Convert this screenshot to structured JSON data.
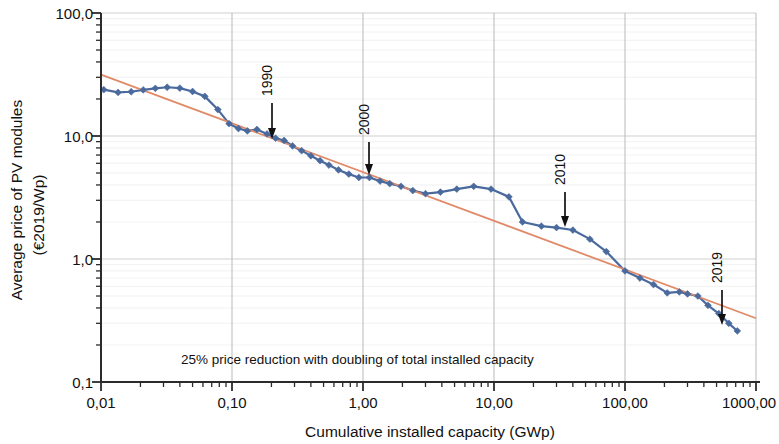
{
  "chart_data": {
    "type": "line",
    "title": "",
    "xlabel": "Cumulative installed capacity (GWp)",
    "ylabel_line1": "Average price of PV modules",
    "ylabel_line2": "(€2019/Wp)",
    "xscale": "log",
    "yscale": "log",
    "xlim": [
      0.01,
      1000
    ],
    "ylim": [
      0.1,
      100
    ],
    "grid": true,
    "legend": "none",
    "xtick_labels": [
      "0,01",
      "0,10",
      "1,00",
      "10,00",
      "100,00",
      "1000,00"
    ],
    "xtick_values": [
      0.01,
      0.1,
      1,
      10,
      100,
      1000
    ],
    "ytick_labels": [
      "100,0",
      "10,0",
      "1,0",
      "0,1"
    ],
    "ytick_values": [
      100,
      10,
      1,
      0.1
    ],
    "annotation_text": "25% price reduction with doubling of total installed capacity",
    "series": [
      {
        "name": "Average price of PV modules",
        "color": "#4a6a9e",
        "marker": "diamond",
        "points": [
          [
            0.0105,
            23.8
          ],
          [
            0.0135,
            22.6
          ],
          [
            0.017,
            22.9
          ],
          [
            0.021,
            23.7
          ],
          [
            0.026,
            24.4
          ],
          [
            0.032,
            24.9
          ],
          [
            0.04,
            24.5
          ],
          [
            0.05,
            23.0
          ],
          [
            0.062,
            21.0
          ],
          [
            0.078,
            16.4
          ],
          [
            0.095,
            12.6
          ],
          [
            0.112,
            11.5
          ],
          [
            0.131,
            11.0
          ],
          [
            0.155,
            11.3
          ],
          [
            0.185,
            10.4
          ],
          [
            0.215,
            9.6
          ],
          [
            0.25,
            9.2
          ],
          [
            0.29,
            8.3
          ],
          [
            0.34,
            7.6
          ],
          [
            0.4,
            6.9
          ],
          [
            0.47,
            6.3
          ],
          [
            0.55,
            5.8
          ],
          [
            0.65,
            5.3
          ],
          [
            0.78,
            4.9
          ],
          [
            0.93,
            4.6
          ],
          [
            1.12,
            4.6
          ],
          [
            1.35,
            4.3
          ],
          [
            1.6,
            4.1
          ],
          [
            1.95,
            3.9
          ],
          [
            2.4,
            3.6
          ],
          [
            3.0,
            3.4
          ],
          [
            3.9,
            3.5
          ],
          [
            5.2,
            3.7
          ],
          [
            7.0,
            3.9
          ],
          [
            9.5,
            3.7
          ],
          [
            13.0,
            3.2
          ],
          [
            16.5,
            2.0
          ],
          [
            23.0,
            1.85
          ],
          [
            30.0,
            1.8
          ],
          [
            40.0,
            1.72
          ],
          [
            54.0,
            1.45
          ],
          [
            72.0,
            1.15
          ],
          [
            100.0,
            0.8
          ],
          [
            130.0,
            0.7
          ],
          [
            165.0,
            0.62
          ],
          [
            210.0,
            0.53
          ],
          [
            260.0,
            0.54
          ],
          [
            300.0,
            0.52
          ],
          [
            360.0,
            0.5
          ],
          [
            430.0,
            0.42
          ],
          [
            520.0,
            0.36
          ],
          [
            620.0,
            0.3
          ],
          [
            720.0,
            0.26
          ]
        ]
      }
    ],
    "trendline": {
      "name": "Learning curve 25% price reduction per doubling",
      "color": "#e08a68",
      "points": [
        [
          0.01,
          31.5
        ],
        [
          1000.0,
          0.33
        ]
      ]
    },
    "annotations": [
      {
        "label": "1990",
        "x": 0.215,
        "y_tip": 9.7,
        "orientation": "vertical"
      },
      {
        "label": "2000",
        "x": 1.12,
        "y_tip": 4.8,
        "orientation": "vertical"
      },
      {
        "label": "2010",
        "x": 40.0,
        "y_tip": 1.85,
        "orientation": "vertical"
      },
      {
        "label": "2019",
        "x": 720.0,
        "y_tip": 0.29,
        "orientation": "vertical"
      }
    ]
  },
  "figure": {
    "xaxis_title": "Cumulative installed capacity (GWp)",
    "yaxis_title_line1": "Average price of PV modules",
    "yaxis_title_line2": "(€2019/Wp)",
    "inline_note": "25% price reduction with doubling of total installed capacity",
    "year_1990": "1990",
    "year_2000": "2000",
    "year_2010": "2010",
    "year_2019": "2019",
    "xtick_0": "0,01",
    "xtick_1": "0,10",
    "xtick_2": "1,00",
    "xtick_3": "10,00",
    "xtick_4": "100,00",
    "xtick_5": "1000,00",
    "ytick_0": "100,0",
    "ytick_1": "10,0",
    "ytick_2": "1,0",
    "ytick_3": "0,1"
  }
}
